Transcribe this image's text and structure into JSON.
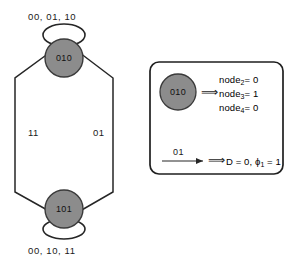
{
  "diagram": {
    "title_present": false,
    "state_machine": {
      "states": [
        {
          "id": "state-top",
          "label": "010",
          "self_loop_label": "00, 01, 10"
        },
        {
          "id": "state-bottom",
          "label": "101",
          "self_loop_label": "00, 10, 11"
        }
      ],
      "transitions": [
        {
          "id": "edge-left",
          "label": "11",
          "from": "010",
          "to": "101"
        },
        {
          "id": "edge-right",
          "label": "01",
          "from": "101",
          "to": "010"
        }
      ]
    },
    "legend": {
      "state_example": {
        "circle_label": "010",
        "implies_symbol": "⟹",
        "lines": [
          {
            "name": "node",
            "sub": "2",
            "eq": "= 0"
          },
          {
            "name": "node",
            "sub": "3",
            "eq": "= 1"
          },
          {
            "name": "node",
            "sub": "4",
            "eq": "= 0"
          }
        ]
      },
      "edge_example": {
        "arrow_label": "01",
        "implies_symbol": "⟹",
        "result_prefix": "D = 0, ",
        "result_symbol": "ϕ",
        "result_sub": "1",
        "result_suffix": " = 1"
      }
    }
  },
  "colors": {
    "node_fill": "#8c8c8c",
    "node_stroke": "#3a3a3a",
    "line": "#262626",
    "text": "#111111",
    "box_stroke": "#1f1f1f",
    "background": "#ffffff"
  }
}
